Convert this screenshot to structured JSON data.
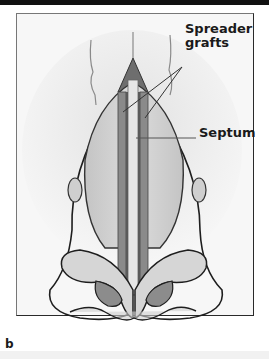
{
  "figure": {
    "panel_letter": "b",
    "labels": {
      "spreader_line1": "Spreader",
      "spreader_line2": "grafts",
      "septum": "Septum"
    }
  },
  "colors": {
    "frame": "#2a2a2a",
    "tissue_light": "#d9d9d9",
    "tissue_mid": "#bdbdbd",
    "tissue_dark": "#8a8a8a",
    "graft_dark": "#6e6e6e",
    "outline": "#1e1e1e"
  }
}
